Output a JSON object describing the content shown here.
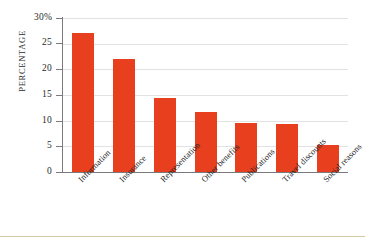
{
  "figure": {
    "top_caption": "",
    "bottom_caption": ""
  },
  "chart_data": {
    "type": "bar",
    "title": "",
    "xlabel": "",
    "ylabel": "PERCENTAGE",
    "categories": [
      "Information",
      "Insurance",
      "Representation",
      "Other benefits",
      "Publications",
      "Travel discounts",
      "Social reasons"
    ],
    "values": [
      27,
      22,
      14.5,
      11.7,
      9.5,
      9.3,
      5.2
    ],
    "ylim": [
      0,
      30
    ],
    "ytick_labels": [
      "0",
      "5",
      "10",
      "15",
      "20",
      "25",
      "30%"
    ],
    "ytick_values": [
      0,
      5,
      10,
      15,
      20,
      25,
      30
    ],
    "grid": true,
    "legend": "none",
    "bar_color": "#e8401f",
    "grid_color": "#e2e2e4",
    "axis_color": "#7a7a7e"
  }
}
